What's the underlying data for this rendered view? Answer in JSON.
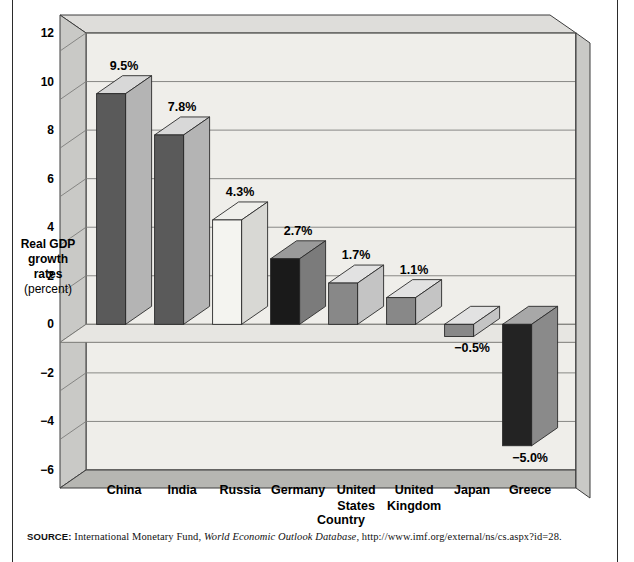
{
  "figure": {
    "source_label": "SOURCE:",
    "source_text_1": " International Monetary Fund, ",
    "source_italic": "World Economic Outlook Database",
    "source_text_2": ", http://www.imf.org/external/ns/cs.aspx?id=28."
  },
  "chart_data": {
    "type": "bar",
    "title": "",
    "subtitle": "",
    "xlabel": "Country",
    "ylabel_lines": [
      "Real GDP",
      "growth",
      "rates",
      "(percent)"
    ],
    "ylabel": "Real GDP growth rates (percent)",
    "categories": [
      "China",
      "India",
      "Russia",
      "Germany",
      "United States",
      "United Kingdom",
      "Japan",
      "Greece"
    ],
    "category_lines": [
      [
        "China"
      ],
      [
        "India"
      ],
      [
        "Russia"
      ],
      [
        "Germany"
      ],
      [
        "United",
        "States"
      ],
      [
        "United",
        "Kingdom"
      ],
      [
        "Japan"
      ],
      [
        "Greece"
      ]
    ],
    "values": [
      9.5,
      7.8,
      4.3,
      2.7,
      1.7,
      1.1,
      -0.5,
      -5.0
    ],
    "data_labels": [
      "9.5%",
      "7.8%",
      "4.3%",
      "2.7%",
      "1.7%",
      "1.1%",
      "−0.5%",
      "−5.0%"
    ],
    "bar_colors": [
      "#5a5a5a",
      "#5a5a5a",
      "#f4f4f0",
      "#1a1a1a",
      "#888888",
      "#888888",
      "#888888",
      "#232323"
    ],
    "bar_side_colors": [
      "#b4b4b4",
      "#b4b4b4",
      "#d8d8d4",
      "#7b7b7b",
      "#c4c4c4",
      "#c4c4c4",
      "#c4c4c4",
      "#8a8a8a"
    ],
    "bar_top_colors": [
      "#d8d8d8",
      "#d8d8d8",
      "#efefeb",
      "#9a9a9a",
      "#e2e2e2",
      "#e2e2e2",
      "#e2e2e2",
      "#a8a8a8"
    ],
    "ylim": [
      -6,
      12
    ],
    "yticks": [
      12,
      10,
      8,
      6,
      4,
      2,
      0,
      -2,
      -4,
      -6
    ],
    "ytick_labels": [
      "12",
      "10",
      "8",
      "6",
      "4",
      "2",
      "0",
      "−2",
      "−4",
      "−6"
    ],
    "grid": true,
    "legend": "none",
    "plot_bg": "#efeeea",
    "wall_color": "#c9c9c6",
    "floor_color": "#b6b6b2",
    "frame_color": "#3c3c3c"
  }
}
